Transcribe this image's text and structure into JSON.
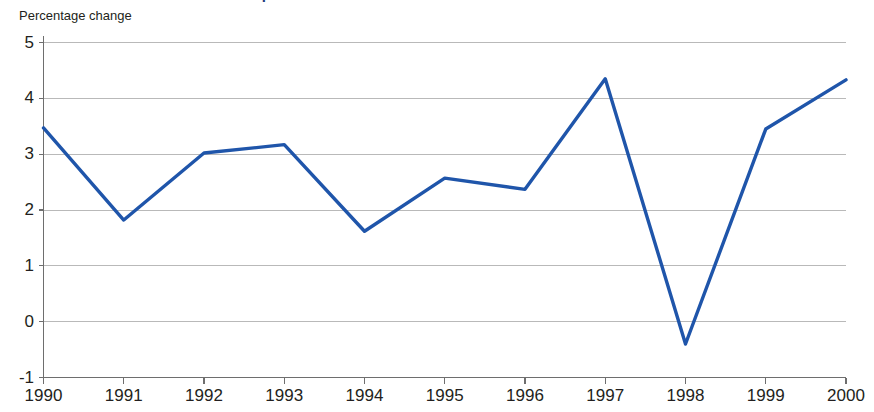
{
  "title": "Chart 1: Growth in household disposable income",
  "axis_caption": "Percentage change",
  "colors": {
    "series_blue": "#1f55aa",
    "title_navy": "#1f3a7a",
    "gridline": "#b9b9b9",
    "axis": "#6e6e6e",
    "text": "#231f20",
    "background": "#ffffff"
  },
  "chart_data": {
    "type": "line",
    "title": "Chart 1: Growth in household disposable income",
    "subtitle": "Percentage change",
    "xlabel": "",
    "ylabel": "Percentage change",
    "categories": [
      "1990",
      "1991",
      "1992",
      "1993",
      "1994",
      "1995",
      "1996",
      "1997",
      "1998",
      "1999",
      "2000"
    ],
    "x": [
      1990,
      1991,
      1992,
      1993,
      1994,
      1995,
      1996,
      1997,
      1998,
      1999,
      2000
    ],
    "values": [
      3.47,
      1.82,
      3.02,
      3.17,
      1.62,
      2.57,
      2.37,
      4.35,
      -0.4,
      3.45,
      4.33
    ],
    "series": [
      {
        "name": "Household disposable income growth",
        "color": "#1f55aa",
        "values": [
          3.47,
          1.82,
          3.02,
          3.17,
          1.62,
          2.57,
          2.37,
          4.35,
          -0.4,
          3.45,
          4.33
        ]
      }
    ],
    "ylim": [
      -1,
      5
    ],
    "yticks": [
      5,
      4,
      3,
      2,
      1,
      0,
      -1
    ],
    "ytick_labels": [
      "5",
      "4",
      "3",
      "2",
      "1",
      "0",
      "-1"
    ],
    "xticks": [
      1990,
      1991,
      1992,
      1993,
      1994,
      1995,
      1996,
      1997,
      1998,
      1999,
      2000
    ],
    "xtick_labels": [
      "1990",
      "1991",
      "1992",
      "1993",
      "1994",
      "1995",
      "1996",
      "1997",
      "1998",
      "1999",
      "2000"
    ],
    "grid": true,
    "grid_axis": "y",
    "legend": false,
    "legend_position": "none",
    "annotations": []
  }
}
